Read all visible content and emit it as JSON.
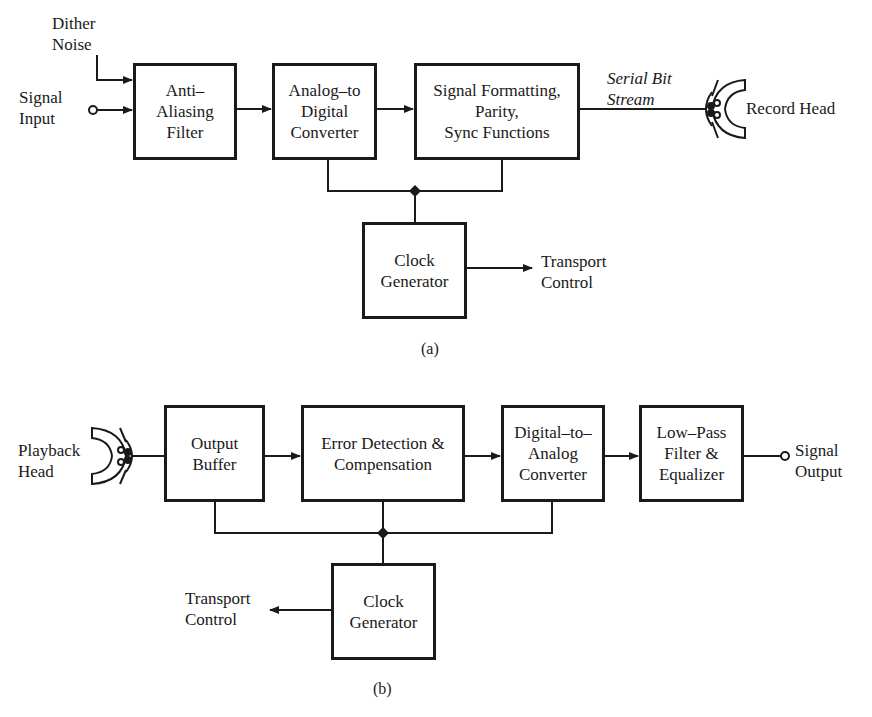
{
  "diagram_a": {
    "caption": "(a)",
    "inputs": {
      "dither_noise": "Dither\nNoise",
      "signal_input": "Signal\nInput"
    },
    "blocks": [
      {
        "id": "anti_aliasing",
        "label": "Anti–\nAliasing\nFilter"
      },
      {
        "id": "adc",
        "label": "Analog–to\nDigital\nConverter"
      },
      {
        "id": "formatting",
        "label": "Signal Formatting,\nParity,\nSync Functions"
      },
      {
        "id": "clock",
        "label": "Clock\nGenerator"
      }
    ],
    "serial_label": "Serial Bit\nStream",
    "record_head": "Record Head",
    "transport_control": "Transport\nControl"
  },
  "diagram_b": {
    "caption": "(b)",
    "playback_head": "Playback\nHead",
    "blocks": [
      {
        "id": "output_buffer",
        "label": "Output\nBuffer"
      },
      {
        "id": "error_detection",
        "label": "Error Detection &\nCompensation"
      },
      {
        "id": "dac",
        "label": "Digital–to–\nAnalog\nConverter"
      },
      {
        "id": "lowpass",
        "label": "Low–Pass\nFilter &\nEqualizer"
      },
      {
        "id": "clock",
        "label": "Clock\nGenerator"
      }
    ],
    "signal_output": "Signal\nOutput",
    "transport_control": "Transport\nControl"
  },
  "colors": {
    "ink": "#1a1a1a",
    "background": "#ffffff"
  }
}
